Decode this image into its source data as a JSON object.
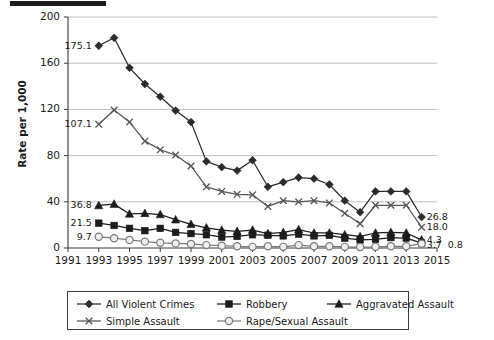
{
  "figure": {
    "top_rule_color": "#1c1c1c",
    "background": "#ffffff",
    "axis_color": "#3a3a3a",
    "grid_color": "#b9b9b9"
  },
  "chart_data": {
    "type": "line",
    "title": "",
    "xlabel": "",
    "ylabel": "Rate per 1,000",
    "xlim": [
      1991,
      2015
    ],
    "ylim": [
      0,
      200
    ],
    "ytick_labels": [
      "0",
      "40",
      "80",
      "120",
      "160",
      "200"
    ],
    "yticks": [
      0,
      40,
      80,
      120,
      160,
      200
    ],
    "xtick_labels": [
      "1991",
      "1993",
      "1995",
      "1997",
      "1999",
      "2001",
      "2003",
      "2005",
      "2007",
      "2009",
      "2011",
      "2013",
      "2015"
    ],
    "xticks": [
      1991,
      1993,
      1995,
      1997,
      1999,
      2001,
      2003,
      2005,
      2007,
      2009,
      2011,
      2013,
      2015
    ],
    "grid": "horizontal",
    "legend_position": "bottom",
    "x": [
      1993,
      1994,
      1995,
      1996,
      1997,
      1998,
      1999,
      2000,
      2001,
      2002,
      2003,
      2004,
      2005,
      2006,
      2007,
      2008,
      2009,
      2010,
      2011,
      2012,
      2013,
      2014
    ],
    "series": [
      {
        "name": "All Violent Crimes",
        "marker": "diamond",
        "color": "#2b2b2b",
        "values": [
          175.1,
          182.0,
          156.0,
          142.0,
          131.0,
          119.0,
          109.0,
          75.0,
          70.0,
          67.0,
          76.0,
          53.0,
          57.0,
          61.0,
          60.0,
          55.0,
          41.0,
          31.0,
          49.0,
          49.0,
          49.0,
          26.8
        ],
        "start_label": "175.1",
        "end_label": "26.8"
      },
      {
        "name": "Robbery",
        "marker": "square",
        "color": "#1c1c1c",
        "values": [
          21.5,
          19.5,
          17.0,
          15.0,
          17.0,
          13.5,
          12.5,
          11.5,
          9.5,
          10.0,
          11.5,
          11.0,
          10.5,
          12.0,
          10.5,
          11.0,
          8.5,
          7.0,
          7.5,
          9.0,
          8.5,
          4.3
        ],
        "start_label": "21.5",
        "end_label": "4.3"
      },
      {
        "name": "Aggravated Assault",
        "marker": "triangle",
        "color": "#1c1c1c",
        "values": [
          36.8,
          38.0,
          29.5,
          30.0,
          29.0,
          24.5,
          20.5,
          17.5,
          15.5,
          14.5,
          15.5,
          12.5,
          13.5,
          16.0,
          13.0,
          13.0,
          11.5,
          10.0,
          13.0,
          13.5,
          13.0,
          7.0
        ],
        "start_label": "36.8",
        "end_label": ""
      },
      {
        "name": "Simple Assault",
        "marker": "cross",
        "color": "#555555",
        "values": [
          107.1,
          119.5,
          109.0,
          92.5,
          85.0,
          80.5,
          71.0,
          53.0,
          49.0,
          46.5,
          46.0,
          36.0,
          41.0,
          40.0,
          41.0,
          39.0,
          30.0,
          21.0,
          37.0,
          37.0,
          37.0,
          18.0
        ],
        "start_label": "107.1",
        "end_label": "18.0"
      },
      {
        "name": "Rape/Sexual Assault",
        "marker": "circle-open",
        "color": "#7a7a7a",
        "values": [
          9.7,
          8.5,
          7.0,
          5.5,
          4.5,
          4.0,
          3.5,
          2.5,
          2.0,
          1.5,
          1.0,
          1.5,
          1.0,
          2.5,
          1.5,
          1.5,
          1.0,
          0.8,
          1.0,
          1.5,
          1.5,
          3.7
        ],
        "start_label": "9.7",
        "end_label": "3.7"
      }
    ],
    "extra_end_label": "0.8",
    "start_labels": [
      "175.1",
      "107.1",
      "36.8",
      "21.5",
      "9.7"
    ],
    "end_labels": [
      "26.8",
      "18.0",
      "4.3",
      "3.7",
      "0.8"
    ]
  },
  "legend": {
    "entries": [
      {
        "label": "All Violent Crimes",
        "marker": "diamond"
      },
      {
        "label": "Robbery",
        "marker": "square"
      },
      {
        "label": "Aggravated Assault",
        "marker": "triangle"
      },
      {
        "label": "Simple Assault",
        "marker": "cross"
      },
      {
        "label": "Rape/Sexual Assault",
        "marker": "circle-open"
      }
    ]
  }
}
